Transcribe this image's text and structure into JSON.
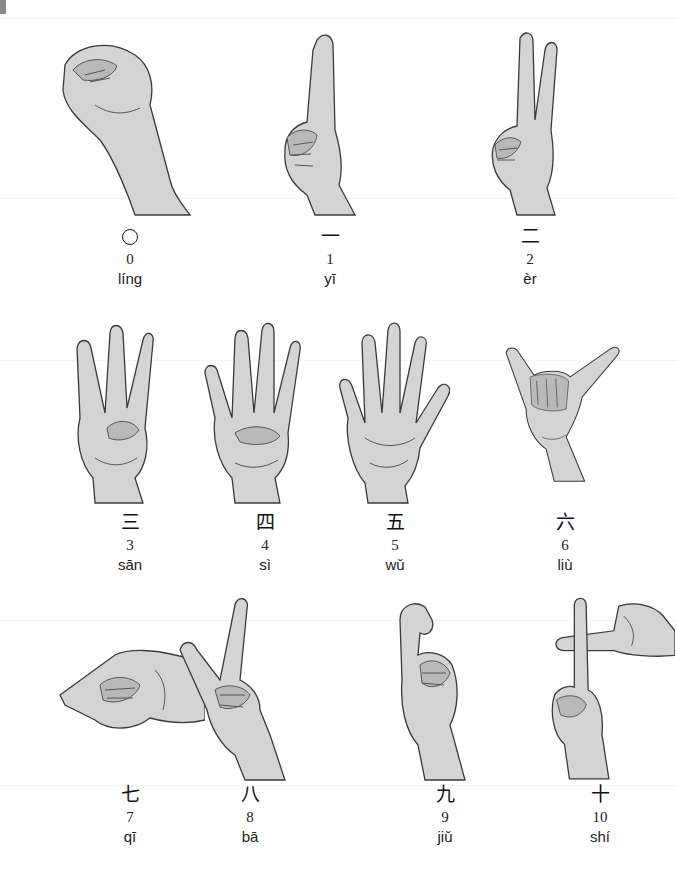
{
  "page": {
    "ink_color": "#222222",
    "skin_tone": "#d4d4d4"
  },
  "numbers": [
    {
      "value": "0",
      "hanzi": "○",
      "pinyin": "líng",
      "gesture": "closed fingertips forming a circle"
    },
    {
      "value": "1",
      "hanzi": "一",
      "pinyin": "yī",
      "gesture": "index finger raised"
    },
    {
      "value": "2",
      "hanzi": "二",
      "pinyin": "èr",
      "gesture": "index and middle fingers raised"
    },
    {
      "value": "3",
      "hanzi": "三",
      "pinyin": "sān",
      "gesture": "middle, ring and little fingers raised"
    },
    {
      "value": "4",
      "hanzi": "四",
      "pinyin": "sì",
      "gesture": "four fingers raised, thumb folded"
    },
    {
      "value": "5",
      "hanzi": "五",
      "pinyin": "wǔ",
      "gesture": "open palm"
    },
    {
      "value": "6",
      "hanzi": "六",
      "pinyin": "liù",
      "gesture": "thumb and little finger extended"
    },
    {
      "value": "7",
      "hanzi": "七",
      "pinyin": "qī",
      "gesture": "fingertips pinched, pointing sideways"
    },
    {
      "value": "8",
      "hanzi": "八",
      "pinyin": "bā",
      "gesture": "thumb and index finger extended"
    },
    {
      "value": "9",
      "hanzi": "九",
      "pinyin": "jiǔ",
      "gesture": "index finger hooked"
    },
    {
      "value": "10",
      "hanzi": "十",
      "pinyin": "shí",
      "gesture": "index fingers crossed"
    }
  ]
}
